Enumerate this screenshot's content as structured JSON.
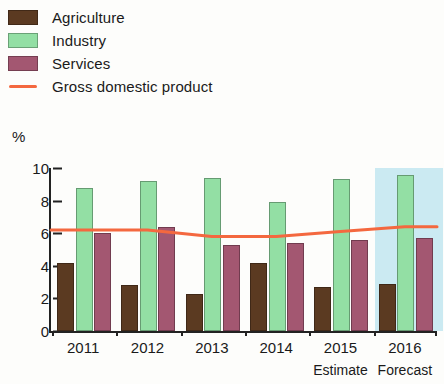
{
  "legend": {
    "items": [
      {
        "label": "Agriculture",
        "color": "#5b3a21",
        "marker": "swatch",
        "name": "legend-agriculture"
      },
      {
        "label": "Industry",
        "color": "#93dfa4",
        "marker": "swatch",
        "name": "legend-industry"
      },
      {
        "label": "Services",
        "color": "#a35771",
        "marker": "swatch",
        "name": "legend-services"
      },
      {
        "label": "Gross domestic product",
        "color": "#f4683f",
        "marker": "line",
        "name": "legend-gdp"
      }
    ]
  },
  "axis": {
    "unit_label": "%",
    "yticks": [
      "10",
      "8",
      "6",
      "4",
      "2",
      "0"
    ],
    "xlabels": [
      "2011",
      "2012",
      "2013",
      "2014",
      "2015",
      "2016"
    ],
    "xsublabels": [
      {
        "index": 4,
        "text": "Estimate"
      },
      {
        "index": 5,
        "text": "Forecast"
      }
    ]
  },
  "colors": {
    "agriculture": "#5b3a21",
    "industry": "#93dfa4",
    "services": "#a35771",
    "gdp_line": "#f4683f",
    "forecast_band": "#cbeaf2",
    "axis": "#222222",
    "background": "#fdfdfb"
  },
  "chart_data": {
    "type": "bar",
    "title": "",
    "subtitle": "",
    "xlabel": "",
    "ylabel": "%",
    "ylim": [
      0,
      10
    ],
    "ytick_step": 2,
    "grid": false,
    "legend_position": "top-left",
    "categories": [
      "2011",
      "2012",
      "2013",
      "2014",
      "2015",
      "2016"
    ],
    "category_notes": [
      "",
      "",
      "",
      "",
      "Estimate",
      "Forecast"
    ],
    "series": [
      {
        "name": "Agriculture",
        "type": "bar",
        "color": "#5b3a21",
        "values": [
          4.2,
          2.8,
          2.3,
          4.2,
          2.7,
          2.9
        ]
      },
      {
        "name": "Industry",
        "type": "bar",
        "color": "#93dfa4",
        "values": [
          8.8,
          9.2,
          9.4,
          7.9,
          9.3,
          9.6
        ]
      },
      {
        "name": "Services",
        "type": "bar",
        "color": "#a35771",
        "values": [
          6.0,
          6.4,
          5.3,
          5.4,
          5.6,
          5.7
        ]
      },
      {
        "name": "Gross domestic product",
        "type": "line",
        "color": "#f4683f",
        "values": [
          6.2,
          6.2,
          5.8,
          5.8,
          6.1,
          6.4
        ]
      }
    ],
    "annotations": [
      {
        "type": "shaded-region",
        "category": "2016",
        "label": "Forecast",
        "color": "#cbeaf2"
      }
    ]
  }
}
